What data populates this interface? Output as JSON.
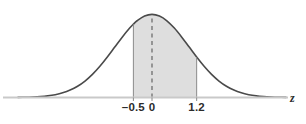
{
  "figure": {
    "type": "normal-distribution-curve",
    "axis_variable_label": "z",
    "tick_labels": {
      "lower_bound": "–0.5",
      "mean": "0",
      "upper_bound": "1.2"
    },
    "colors": {
      "curve_stroke": "#4a4a4a",
      "shaded_area": "#dedede",
      "axis_line": "#c9c9c9",
      "boundary_line": "#8a8a8a",
      "dashed_line": "#5a5a5a",
      "label_text": "#2b2b2b",
      "background": "#ffffff"
    }
  },
  "chart_data": {
    "type": "area",
    "title": "",
    "subtitle": "",
    "xlabel": "z",
    "ylabel": "",
    "distribution": "standard normal",
    "mean": 0,
    "standard_deviation": 1,
    "xlim": [
      -3.6,
      3.6
    ],
    "ylim": [
      0,
      0.42
    ],
    "grid": false,
    "legend": null,
    "tick_values": [
      -0.5,
      0,
      1.2
    ],
    "tick_labels": [
      "–0.5",
      "0",
      "1.2"
    ],
    "shaded_region": {
      "from": -0.5,
      "to": 1.2,
      "fill": "#dedede",
      "label": ""
    },
    "reference_lines": [
      {
        "x": 0,
        "style": "dashed",
        "from_y": 0,
        "to_y": 0.3989
      },
      {
        "x": -0.5,
        "style": "solid",
        "from_y": 0,
        "to_y": 0.3521
      },
      {
        "x": 1.2,
        "style": "solid",
        "from_y": 0,
        "to_y": 0.1942
      }
    ],
    "x": [
      -3.6,
      -3.4,
      -3.2,
      -3.0,
      -2.8,
      -2.6,
      -2.4,
      -2.2,
      -2.0,
      -1.8,
      -1.6,
      -1.4,
      -1.2,
      -1.0,
      -0.8,
      -0.6,
      -0.5,
      -0.4,
      -0.2,
      0.0,
      0.2,
      0.4,
      0.6,
      0.8,
      1.0,
      1.2,
      1.4,
      1.6,
      1.8,
      2.0,
      2.2,
      2.4,
      2.6,
      2.8,
      3.0,
      3.2,
      3.4,
      3.6
    ],
    "y": [
      0.0006,
      0.0012,
      0.0024,
      0.0044,
      0.0079,
      0.0136,
      0.0224,
      0.0355,
      0.054,
      0.079,
      0.1109,
      0.1497,
      0.1942,
      0.242,
      0.2897,
      0.3332,
      0.3521,
      0.3683,
      0.391,
      0.3989,
      0.391,
      0.3683,
      0.3332,
      0.2897,
      0.242,
      0.1942,
      0.1497,
      0.1109,
      0.079,
      0.054,
      0.0355,
      0.0224,
      0.0136,
      0.0079,
      0.0044,
      0.0024,
      0.0012,
      0.0006
    ]
  }
}
